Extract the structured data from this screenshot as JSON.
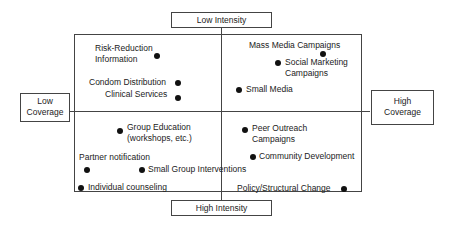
{
  "axes": {
    "top": "Low Intensity",
    "bottom": "High Intensity",
    "left_line1": "Low",
    "left_line2": "Coverage",
    "right_line1": "High",
    "right_line2": "Coverage"
  },
  "quadrants": {
    "low_intensity_low_coverage": [
      {
        "line1": "Risk-Reduction",
        "line2": "Information"
      },
      {
        "line1": "Condom Distribution"
      },
      {
        "line1": "Clinical Services"
      }
    ],
    "low_intensity_high_coverage": [
      {
        "line1": "Mass Media Campaigns"
      },
      {
        "line1": "Social Marketing",
        "line2": "Campaigns"
      },
      {
        "line1": "Small Media"
      }
    ],
    "high_intensity_low_coverage": [
      {
        "line1": "Group Education",
        "line2": "(workshops, etc.)"
      },
      {
        "line1": "Partner notification"
      },
      {
        "line1": "Small Group Interventions"
      },
      {
        "line1": "Individual counseling"
      }
    ],
    "high_intensity_high_coverage": [
      {
        "line1": "Peer Outreach",
        "line2": "Campaigns"
      },
      {
        "line1": "Community Development"
      },
      {
        "line1": "Policy/Structural Change"
      }
    ]
  },
  "colors": {
    "line": "#444444",
    "dot": "#111111",
    "text": "#222222"
  }
}
